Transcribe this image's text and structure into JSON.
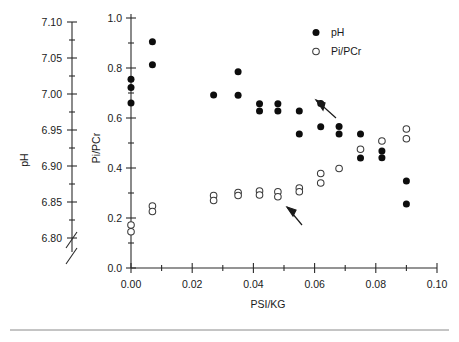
{
  "figure": {
    "background": "#ffffff",
    "ink_color": "#0d0d0d"
  },
  "left_axis": {
    "title": "pH",
    "ticks": [
      "6.80",
      "6.85",
      "6.90",
      "6.95",
      "7.00",
      "7.05",
      "7.10"
    ],
    "min": 6.8,
    "max": 7.1,
    "has_axis_break": true,
    "break_symbol": "//"
  },
  "legend": {
    "position": "top-right",
    "entries": [
      {
        "marker": "filled-circle",
        "label": "pH"
      },
      {
        "marker": "open-circle",
        "label": "Pi/PCr"
      }
    ]
  },
  "annotations": [
    {
      "name": "upper-arrow",
      "points_to": "pH-series",
      "direction": "up-left"
    },
    {
      "name": "lower-arrow",
      "points_to": "Pi-PCr-series",
      "direction": "up-left"
    }
  ],
  "chart_data": {
    "type": "scatter",
    "title": "",
    "xlabel": "PSI/KG",
    "ylabel": "Pi/PCr",
    "y2label": "pH",
    "xlim": [
      0.0,
      0.1
    ],
    "ylim": [
      0.0,
      1.0
    ],
    "xticks": [
      "0.00",
      "0.02",
      "0.04",
      "0.06",
      "0.08",
      "0.10"
    ],
    "xtick_values": [
      0.0,
      0.02,
      0.04,
      0.06,
      0.08,
      0.1
    ],
    "yticks": [
      "0.0",
      "0.2",
      "0.4",
      "0.6",
      "0.8",
      "1.0"
    ],
    "ytick_values": [
      0.0,
      0.2,
      0.4,
      0.6,
      0.8,
      1.0
    ],
    "x_minor_step": 0.01,
    "y_minor_step": 0.1,
    "grid": false,
    "legend_position": "upper right",
    "series": [
      {
        "name": "pH",
        "marker": "filled-circle",
        "color": "#0d0d0d",
        "points": [
          [
            0.0,
            0.755
          ],
          [
            0.0,
            0.722
          ],
          [
            0.0,
            0.66
          ],
          [
            0.007,
            0.905
          ],
          [
            0.007,
            0.813
          ],
          [
            0.027,
            0.692
          ],
          [
            0.035,
            0.785
          ],
          [
            0.035,
            0.691
          ],
          [
            0.042,
            0.657
          ],
          [
            0.042,
            0.628
          ],
          [
            0.048,
            0.657
          ],
          [
            0.048,
            0.628
          ],
          [
            0.055,
            0.628
          ],
          [
            0.055,
            0.536
          ],
          [
            0.062,
            0.658
          ],
          [
            0.062,
            0.565
          ],
          [
            0.068,
            0.566
          ],
          [
            0.068,
            0.536
          ],
          [
            0.075,
            0.536
          ],
          [
            0.075,
            0.44
          ],
          [
            0.082,
            0.468
          ],
          [
            0.082,
            0.441
          ],
          [
            0.09,
            0.348
          ],
          [
            0.09,
            0.256
          ]
        ]
      },
      {
        "name": "Pi/PCr",
        "marker": "open-circle",
        "color": "#3a3a3a",
        "points": [
          [
            0.0,
            0.172
          ],
          [
            0.0,
            0.145
          ],
          [
            0.007,
            0.248
          ],
          [
            0.007,
            0.226
          ],
          [
            0.027,
            0.29
          ],
          [
            0.027,
            0.27
          ],
          [
            0.035,
            0.302
          ],
          [
            0.035,
            0.29
          ],
          [
            0.042,
            0.308
          ],
          [
            0.042,
            0.292
          ],
          [
            0.048,
            0.305
          ],
          [
            0.048,
            0.285
          ],
          [
            0.055,
            0.32
          ],
          [
            0.055,
            0.305
          ],
          [
            0.062,
            0.378
          ],
          [
            0.062,
            0.34
          ],
          [
            0.068,
            0.398
          ],
          [
            0.075,
            0.475
          ],
          [
            0.082,
            0.508
          ],
          [
            0.09,
            0.556
          ],
          [
            0.09,
            0.517
          ]
        ]
      }
    ]
  }
}
